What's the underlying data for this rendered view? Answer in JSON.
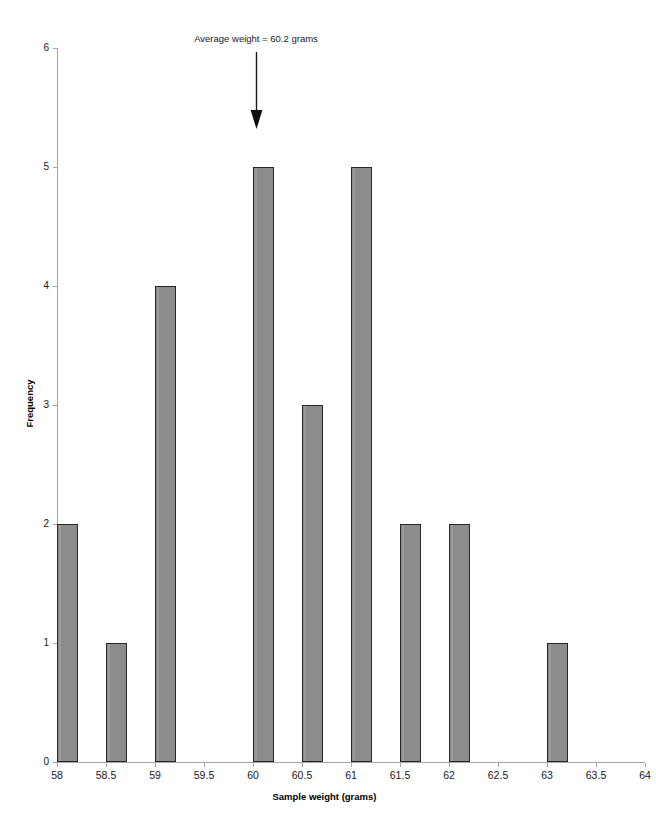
{
  "chart_data": {
    "type": "bar",
    "title": "",
    "xlabel": "Sample weight (grams)",
    "ylabel": "Frequency",
    "categories": [
      "58",
      "58.5",
      "59",
      "59.5",
      "60",
      "60.5",
      "61",
      "61.5",
      "62",
      "62.5",
      "63",
      "63.5",
      "64"
    ],
    "values": [
      2,
      1,
      4,
      0,
      5,
      3,
      5,
      2,
      2,
      0,
      1,
      0,
      0
    ],
    "ylim": [
      0,
      6
    ],
    "y_ticks": [
      "0",
      "1",
      "2",
      "3",
      "4",
      "5",
      "6"
    ],
    "grid": false,
    "legend": null,
    "bar_color": "#8c8c8c",
    "bar_border_color": "#262626",
    "axis_color": "#a6a6a6",
    "annotations": [
      {
        "text": "Average weight = 60.2 grams",
        "points_to_category": "60",
        "value": 60.2,
        "marker": "down-arrow"
      }
    ]
  },
  "axes": {
    "x_title": "Sample weight (grams)",
    "y_title": "Frequency",
    "x_tick_labels": [
      "58",
      "58.5",
      "59",
      "59.5",
      "60",
      "60.5",
      "61",
      "61.5",
      "62",
      "62.5",
      "63",
      "63.5",
      "64"
    ],
    "y_tick_labels": [
      "0",
      "1",
      "2",
      "3",
      "4",
      "5",
      "6"
    ]
  },
  "annotation": {
    "label": "Average weight = 60.2 grams"
  }
}
